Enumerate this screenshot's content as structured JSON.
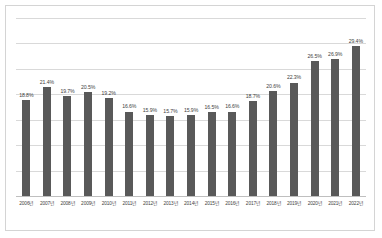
{
  "chart_data": {
    "type": "bar",
    "title": "",
    "xlabel": "",
    "ylabel": "",
    "categories": [
      "2006년",
      "2007년",
      "2008년",
      "2009년",
      "2010년",
      "2011년",
      "2012년",
      "2013년",
      "2014년",
      "2015년",
      "2016년",
      "2017년",
      "2018년",
      "2019년",
      "2020년",
      "2021년",
      "2022년"
    ],
    "values": [
      18.8,
      21.4,
      19.7,
      20.5,
      19.2,
      16.6,
      15.9,
      15.7,
      15.9,
      16.5,
      16.6,
      18.7,
      20.6,
      22.3,
      26.5,
      26.9,
      29.4
    ],
    "data_labels": [
      "18.8%",
      "21.4%",
      "19.7%",
      "20.5%",
      "19.2%",
      "16.6%",
      "15.9%",
      "15.7%",
      "15.9%",
      "16.5%",
      "16.6%",
      "18.7%",
      "20.6%",
      "22.3%",
      "26.5%",
      "26.9%",
      "29.4%"
    ],
    "ylim": [
      0,
      35
    ],
    "gridlines": [
      5,
      10,
      15,
      20,
      25,
      30,
      35
    ],
    "grid": true,
    "legend": "none",
    "bar_color": "#595959",
    "gridline_color": "#d9d9d9",
    "border_color": "#d4d4d4"
  }
}
